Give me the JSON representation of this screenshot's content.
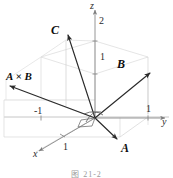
{
  "figure": {
    "caption": "图 21-2"
  },
  "axes": {
    "x": {
      "label": "x",
      "tick_labels": [
        "1"
      ]
    },
    "y": {
      "label": "y",
      "tick_labels": [
        "1",
        "-1"
      ]
    },
    "z": {
      "label": "z",
      "tick_labels": [
        "1",
        "2"
      ]
    }
  },
  "ticks": {
    "z_two": "2",
    "z_one": "1",
    "y_one": "1",
    "y_neg_one": "-1",
    "x_one": "1"
  },
  "vectors": {
    "a": {
      "label": "A"
    },
    "b": {
      "label": "B"
    },
    "c": {
      "label": "C"
    },
    "cross": {
      "label": "A × B"
    }
  },
  "colors": {
    "vector_stroke": "#2a2a2a",
    "axis_stroke": "#8a8a8a",
    "grid_stroke": "#c8c8c8",
    "grid_stroke_light": "#d8d8d8",
    "caption_color": "#9a9a9a",
    "background": "#ffffff"
  },
  "geometry": {
    "origin": {
      "x": 95,
      "y": 118
    },
    "a_tip": {
      "x": 119,
      "y": 141
    },
    "b_tip": {
      "x": 152,
      "y": 71
    },
    "c_tip": {
      "x": 66,
      "y": 33
    },
    "cross_tip": {
      "x": 8,
      "y": 85
    }
  }
}
